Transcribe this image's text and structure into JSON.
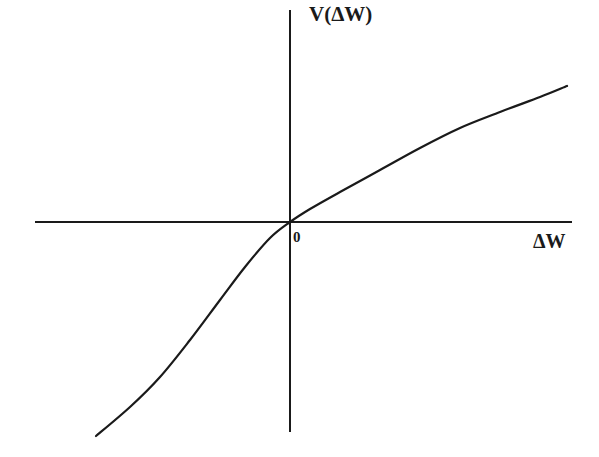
{
  "chart_data": {
    "type": "line",
    "title": "",
    "xlabel": "ΔW",
    "ylabel": "V(ΔW)",
    "origin_label": "0",
    "grid": false,
    "legend": null,
    "axis_pixels": {
      "origin": [
        290,
        222
      ],
      "x_axis": [
        35,
        572
      ],
      "y_axis": [
        10,
        432
      ]
    },
    "series": [
      {
        "name": "V(ΔW)",
        "color": "#1a1a1a",
        "x": [
          -194,
          -160,
          -130,
          -100,
          -70,
          -45,
          -20,
          0,
          20,
          50,
          90,
          130,
          170,
          210,
          250,
          277
        ],
        "y": [
          -214,
          -185,
          -155,
          -118,
          -78,
          -45,
          -16,
          0,
          13,
          30,
          52,
          74,
          94,
          110,
          125,
          136
        ]
      }
    ]
  },
  "colors": {
    "background": "#ffffff",
    "ink": "#1a1a1a"
  }
}
